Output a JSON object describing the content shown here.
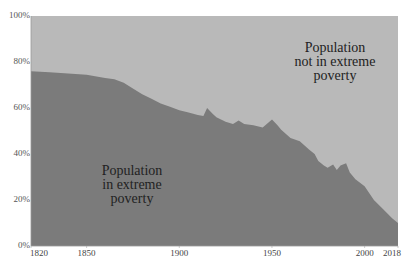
{
  "chart_data": {
    "type": "area",
    "stacked": true,
    "title": "",
    "xlabel": "",
    "ylabel": "",
    "xlim": [
      1820,
      2018
    ],
    "ylim": [
      0,
      100
    ],
    "grid": false,
    "legend": "none (inline annotations)",
    "x_tick_labels": [
      "1820",
      "1850",
      "1900",
      "1950",
      "2000",
      "2018"
    ],
    "y_tick_labels": [
      "0%",
      "20%",
      "40%",
      "60%",
      "80%",
      "100%"
    ],
    "x": [
      1820,
      1830,
      1840,
      1850,
      1860,
      1865,
      1870,
      1875,
      1880,
      1885,
      1890,
      1895,
      1900,
      1905,
      1910,
      1913,
      1915,
      1918,
      1920,
      1925,
      1929,
      1932,
      1935,
      1940,
      1945,
      1950,
      1953,
      1955,
      1960,
      1965,
      1970,
      1973,
      1975,
      1978,
      1980,
      1983,
      1985,
      1987,
      1990,
      1992,
      1995,
      2000,
      2005,
      2010,
      2015,
      2018
    ],
    "series": [
      {
        "name": "Population in extreme poverty",
        "color": "#7b7b7b",
        "values": [
          76,
          75.5,
          75,
          74.5,
          73,
          72.5,
          71,
          68.5,
          66,
          64,
          62,
          60.5,
          59,
          58,
          57,
          56.5,
          60,
          57.5,
          56,
          54,
          53,
          54.5,
          53,
          52.5,
          51.5,
          55,
          52.5,
          50.5,
          47,
          45.5,
          42,
          40,
          37,
          35,
          34,
          35.5,
          33,
          35,
          36,
          32,
          29,
          26,
          20,
          16,
          12,
          10
        ]
      },
      {
        "name": "Population not in extreme poverty",
        "color": "#b9b9b9",
        "values": [
          24,
          24.5,
          25,
          25.5,
          27,
          27.5,
          29,
          31.5,
          34,
          36,
          38,
          39.5,
          41,
          42,
          43,
          43.5,
          40,
          42.5,
          44,
          46,
          47,
          45.5,
          47,
          47.5,
          48.5,
          45,
          47.5,
          49.5,
          53,
          54.5,
          58,
          60,
          63,
          65,
          66,
          64.5,
          67,
          65,
          64,
          68,
          71,
          74,
          80,
          84,
          88,
          90
        ]
      }
    ],
    "annotations": [
      {
        "text": [
          "Population",
          "in extreme",
          "poverty"
        ],
        "position": "lower-left, inside dark area"
      },
      {
        "text": [
          "Population",
          "not in extreme",
          "poverty"
        ],
        "position": "upper-right, inside light area"
      }
    ]
  },
  "labels": {
    "annot_poor": [
      "Population",
      "in extreme",
      "poverty"
    ],
    "annot_nonpoor": [
      "Population",
      "not in extreme",
      "poverty"
    ]
  }
}
